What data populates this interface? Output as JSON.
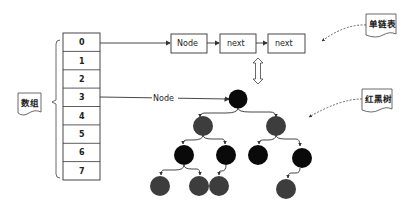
{
  "array": {
    "label": "数组",
    "cells": [
      "0",
      "1",
      "2",
      "3",
      "4",
      "5",
      "6",
      "7"
    ]
  },
  "linked_list": {
    "label": "单链表",
    "nodes": [
      "Node",
      "next",
      "next"
    ]
  },
  "tree": {
    "label": "红黑树",
    "entry_label": "Node"
  },
  "colors": {
    "black_node": "#0a0a0a",
    "red_node": "#3d3d3d",
    "line": "#333333"
  }
}
